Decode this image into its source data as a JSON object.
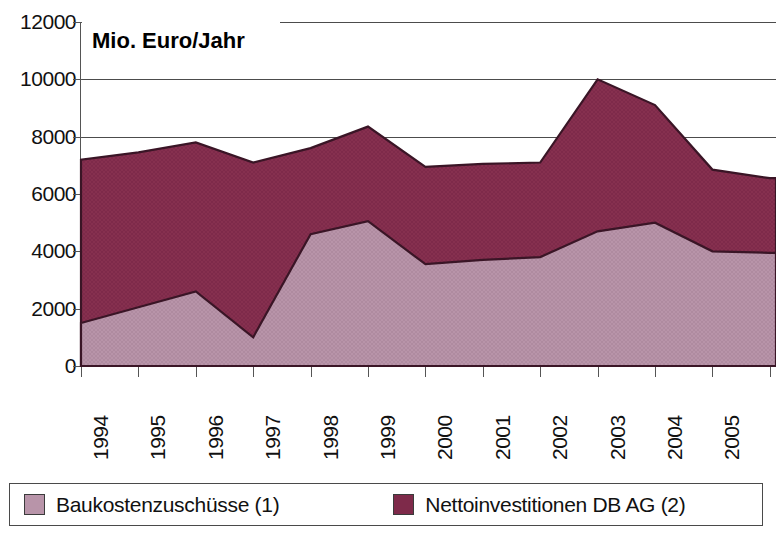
{
  "chart_data": {
    "type": "area",
    "stacked": true,
    "title": "Mio. Euro/Jahr",
    "xlabel": "",
    "ylabel": "Mio. Euro/Jahr",
    "ylim": [
      0,
      12000
    ],
    "ytick_step": 2000,
    "ytick_labels": [
      "12000",
      "10000",
      "8000",
      "6000",
      "4000",
      "2000",
      "0"
    ],
    "ytick_values": [
      12000,
      10000,
      8000,
      6000,
      4000,
      2000,
      0
    ],
    "grid": true,
    "grid_axis": "y",
    "legend_position": "bottom",
    "categories": [
      "1994",
      "1995",
      "1996",
      "1997",
      "1998",
      "1999",
      "2000",
      "2001",
      "2002",
      "2003",
      "2004",
      "2005",
      "2006"
    ],
    "x": [
      1994,
      1995,
      1996,
      1997,
      1998,
      1999,
      2000,
      2001,
      2002,
      2003,
      2004,
      2005,
      2006
    ],
    "series": [
      {
        "name": "Baukostenzuschüsse (1)",
        "color": "#b894a9",
        "values": [
          1500,
          2050,
          2600,
          1000,
          4600,
          5050,
          3550,
          3700,
          3800,
          4700,
          5000,
          4000,
          3950
        ]
      },
      {
        "name": "Nettoinvestitionen DB AG (2)",
        "color": "#7e2a4a",
        "values": [
          5700,
          5400,
          5200,
          6100,
          3000,
          3300,
          3400,
          3350,
          3300,
          5300,
          4100,
          2850,
          2600
        ]
      }
    ],
    "totals": [
      7200,
      7450,
      7800,
      7100,
      7600,
      8350,
      6950,
      7050,
      7100,
      10000,
      9100,
      6850,
      6550
    ],
    "colors": {
      "series_light": "#b894a9",
      "series_dark": "#7e2a4a",
      "outline": "#3a1526",
      "gridline": "#4c4c4c",
      "axis": "#555555",
      "text": "#111111",
      "background": "#ffffff"
    }
  },
  "chart": {
    "title": "Mio. Euro/Jahr"
  },
  "legend": {
    "items": [
      {
        "label": "Baukostenzuschüsse (1)",
        "color": "#b894a9"
      },
      {
        "label": "Nettoinvestitionen DB AG (2)",
        "color": "#7e2a4a"
      }
    ]
  }
}
